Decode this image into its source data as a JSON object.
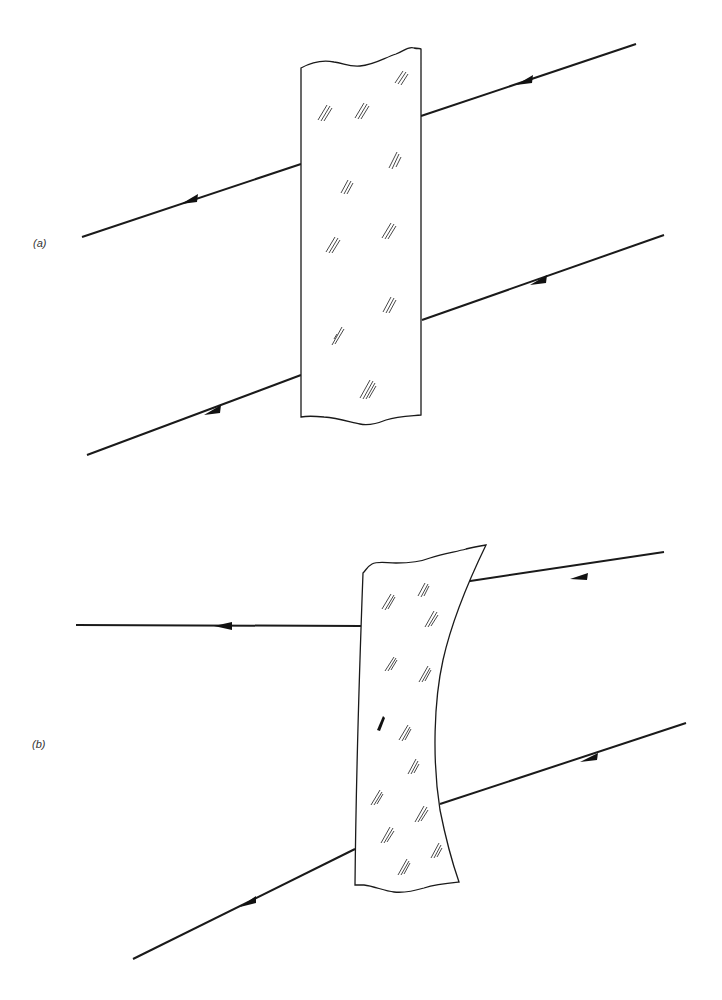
{
  "figure": {
    "panels": [
      {
        "id": "a",
        "label": "(a)",
        "description": "Parallel-sided glass slab; incoming parallel rays exit parallel (laterally displaced)",
        "slab_shape": "rectangle",
        "rays": [
          {
            "incident": [
              [
                636,
                44
              ],
              [
                421,
                116
              ]
            ],
            "emergent": [
              [
                301,
                164
              ],
              [
                82,
                237
              ]
            ]
          },
          {
            "incident": [
              [
                664,
                235
              ],
              [
                422,
                320
              ]
            ],
            "emergent": [
              [
                301,
                375
              ],
              [
                87,
                455
              ]
            ]
          }
        ]
      },
      {
        "id": "b",
        "label": "(b)",
        "description": "Tapered glass slab with curved (concave) face; emerging rays diverge",
        "slab_shape": "tapered-concave",
        "rays": [
          {
            "incident": [
              [
                664,
                552
              ],
              [
                457,
                583
              ]
            ],
            "emergent": [
              [
                361,
                626
              ],
              [
                76,
                625
              ]
            ]
          },
          {
            "incident": [
              [
                686,
                723
              ],
              [
                440,
                804
              ]
            ],
            "emergent": [
              [
                355,
                849
              ],
              [
                133,
                959
              ]
            ]
          }
        ]
      }
    ],
    "colors": {
      "ink": "#1a1a1a",
      "background": "#ffffff"
    }
  }
}
